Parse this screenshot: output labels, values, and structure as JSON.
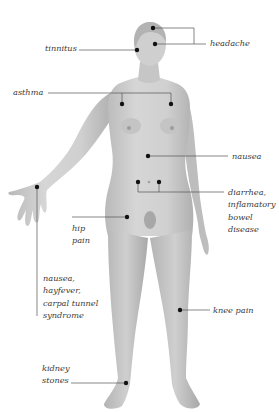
{
  "diagram": {
    "type": "anatomical-symptom-map",
    "colors": {
      "background": "#ffffff",
      "skin": "#cfcfcf",
      "skin_shadow": "#a9a9a9",
      "hair": "#b8b8b8",
      "marker": "#111111",
      "leader_line": "#555555",
      "text": "#3a3a3a"
    }
  },
  "labels": {
    "headache": [
      "headache"
    ],
    "tinnitus": [
      "tinnitus"
    ],
    "asthma": [
      "asthma"
    ],
    "nausea_abdomen": [
      "nausea"
    ],
    "digestive": [
      "diarrhea,",
      "inflamatory",
      "bowel",
      "disease"
    ],
    "hip": [
      "hip",
      "pain"
    ],
    "wrist": [
      "nausea,",
      "hayfever,",
      "carpal tunnel",
      "syndrome"
    ],
    "knee": [
      "knee pain"
    ],
    "kidney": [
      "kidney",
      "stones"
    ]
  },
  "points": [
    {
      "id": "headache-crown",
      "label": "headache",
      "x": 153,
      "y": 28
    },
    {
      "id": "headache-forehead",
      "label": "headache",
      "x": 155,
      "y": 44
    },
    {
      "id": "tinnitus-temple",
      "label": "tinnitus",
      "x": 137,
      "y": 50
    },
    {
      "id": "asthma-left-chest",
      "label": "asthma",
      "x": 122,
      "y": 104
    },
    {
      "id": "asthma-right-chest",
      "label": "asthma",
      "x": 171,
      "y": 104
    },
    {
      "id": "nausea-stomach",
      "label": "nausea",
      "x": 148,
      "y": 156
    },
    {
      "id": "digestive-left",
      "label": "diarrhea, inflamatory bowel disease",
      "x": 138,
      "y": 182
    },
    {
      "id": "digestive-right",
      "label": "diarrhea, inflamatory bowel disease",
      "x": 159,
      "y": 182
    },
    {
      "id": "hip-pain",
      "label": "hip pain",
      "x": 127,
      "y": 217
    },
    {
      "id": "wrist",
      "label": "nausea, hayfever, carpal tunnel syndrome",
      "x": 37,
      "y": 187
    },
    {
      "id": "knee-pain",
      "label": "knee pain",
      "x": 180,
      "y": 310
    },
    {
      "id": "kidney-stones-ankle",
      "label": "kidney stones",
      "x": 126,
      "y": 383
    }
  ]
}
